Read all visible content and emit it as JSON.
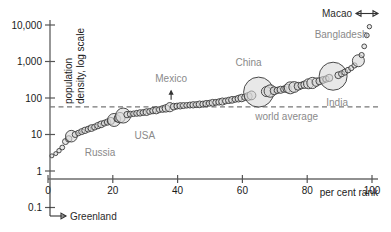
{
  "chart_data": {
    "type": "scatter",
    "title": "",
    "xlabel": "per cent rank",
    "ylabel_line1": "population",
    "ylabel_line2": "density, log scale",
    "xlim": [
      0,
      100
    ],
    "ylim": [
      0.1,
      30000
    ],
    "log_y": true,
    "grid": false,
    "x_ticks": [
      "0",
      "20",
      "40",
      "60",
      "80",
      "100"
    ],
    "x_tick_values": [
      0,
      20,
      40,
      60,
      80,
      100
    ],
    "y_ticks": [
      "10,000",
      "1,000",
      "100",
      "10",
      "1",
      "0.1"
    ],
    "y_tick_values": [
      10000,
      1000,
      100,
      10,
      1,
      0.1
    ],
    "reference_line": {
      "label": "world average",
      "value": 57
    },
    "annotations": [
      {
        "name": "Greenland",
        "note": "off-scale low, below 0.1",
        "arrow": "right"
      },
      {
        "name": "Macao",
        "note": "off-scale high, above 10,000",
        "arrow": "right"
      }
    ],
    "labelled_points": [
      {
        "name": "Russia",
        "x": 7,
        "y": 9
      },
      {
        "name": "USA",
        "x": 23,
        "y": 34
      },
      {
        "name": "Mexico",
        "x": 38,
        "y": 61
      },
      {
        "name": "China",
        "x": 65,
        "y": 145
      },
      {
        "name": "India",
        "x": 88,
        "y": 395
      },
      {
        "name": "Bangladesh",
        "x": 96,
        "y": 1100
      }
    ],
    "points": [
      {
        "x": 1.2,
        "y": 2.6,
        "r": 2.0
      },
      {
        "x": 2.4,
        "y": 3.0,
        "r": 2.0
      },
      {
        "x": 3.4,
        "y": 3.6,
        "r": 2.2
      },
      {
        "x": 4.4,
        "y": 4.4,
        "r": 2.4
      },
      {
        "x": 5.4,
        "y": 6.4,
        "r": 3.0
      },
      {
        "x": 6.4,
        "y": 7.6,
        "r": 3.2
      },
      {
        "x": 7.2,
        "y": 9.0,
        "r": 5.8
      },
      {
        "x": 8.4,
        "y": 10.0,
        "r": 3.0
      },
      {
        "x": 9.4,
        "y": 11.0,
        "r": 2.8
      },
      {
        "x": 10.4,
        "y": 12.0,
        "r": 3.0
      },
      {
        "x": 11.4,
        "y": 13.0,
        "r": 3.2
      },
      {
        "x": 12.4,
        "y": 14.0,
        "r": 3.0
      },
      {
        "x": 13.4,
        "y": 15.0,
        "r": 3.4
      },
      {
        "x": 14.4,
        "y": 16.0,
        "r": 3.0
      },
      {
        "x": 15.4,
        "y": 17.5,
        "r": 3.2
      },
      {
        "x": 16.4,
        "y": 19.0,
        "r": 3.4
      },
      {
        "x": 17.4,
        "y": 20.5,
        "r": 3.0
      },
      {
        "x": 18.4,
        "y": 22.0,
        "r": 3.2
      },
      {
        "x": 19.4,
        "y": 23.5,
        "r": 3.6
      },
      {
        "x": 20.4,
        "y": 25.0,
        "r": 6.5
      },
      {
        "x": 21.4,
        "y": 27.0,
        "r": 3.4
      },
      {
        "x": 22.2,
        "y": 29.0,
        "r": 5.2
      },
      {
        "x": 23.2,
        "y": 33.0,
        "r": 7.5
      },
      {
        "x": 24.4,
        "y": 35.0,
        "r": 3.2
      },
      {
        "x": 25.4,
        "y": 36.0,
        "r": 3.0
      },
      {
        "x": 26.4,
        "y": 37.0,
        "r": 2.8
      },
      {
        "x": 27.4,
        "y": 38.0,
        "r": 3.0
      },
      {
        "x": 28.4,
        "y": 39.0,
        "r": 3.2
      },
      {
        "x": 29.4,
        "y": 40.0,
        "r": 3.0
      },
      {
        "x": 30.4,
        "y": 41.0,
        "r": 3.4
      },
      {
        "x": 31.4,
        "y": 43.0,
        "r": 3.0
      },
      {
        "x": 32.4,
        "y": 45.0,
        "r": 3.2
      },
      {
        "x": 33.4,
        "y": 46.0,
        "r": 3.6
      },
      {
        "x": 34.4,
        "y": 48.0,
        "r": 3.0
      },
      {
        "x": 35.4,
        "y": 50.0,
        "r": 3.4
      },
      {
        "x": 36.4,
        "y": 52.0,
        "r": 3.8
      },
      {
        "x": 37.6,
        "y": 56.0,
        "r": 4.6
      },
      {
        "x": 38.8,
        "y": 58.0,
        "r": 3.4
      },
      {
        "x": 39.8,
        "y": 60.0,
        "r": 3.0
      },
      {
        "x": 40.8,
        "y": 61.0,
        "r": 3.2
      },
      {
        "x": 41.8,
        "y": 62.0,
        "r": 3.0
      },
      {
        "x": 42.8,
        "y": 63.0,
        "r": 2.8
      },
      {
        "x": 43.8,
        "y": 64.0,
        "r": 3.0
      },
      {
        "x": 44.8,
        "y": 65.0,
        "r": 3.2
      },
      {
        "x": 45.8,
        "y": 66.0,
        "r": 3.0
      },
      {
        "x": 46.8,
        "y": 67.0,
        "r": 3.4
      },
      {
        "x": 47.8,
        "y": 68.0,
        "r": 3.0
      },
      {
        "x": 48.8,
        "y": 70.0,
        "r": 3.2
      },
      {
        "x": 49.8,
        "y": 72.0,
        "r": 3.0
      },
      {
        "x": 50.8,
        "y": 74.0,
        "r": 3.4
      },
      {
        "x": 51.8,
        "y": 76.0,
        "r": 3.0
      },
      {
        "x": 52.8,
        "y": 78.0,
        "r": 3.2
      },
      {
        "x": 53.8,
        "y": 80.0,
        "r": 3.6
      },
      {
        "x": 54.8,
        "y": 83.0,
        "r": 3.0
      },
      {
        "x": 55.8,
        "y": 86.0,
        "r": 3.2
      },
      {
        "x": 56.8,
        "y": 89.0,
        "r": 3.4
      },
      {
        "x": 57.8,
        "y": 92.0,
        "r": 3.0
      },
      {
        "x": 58.8,
        "y": 96.0,
        "r": 3.4
      },
      {
        "x": 59.8,
        "y": 100.0,
        "r": 3.8
      },
      {
        "x": 60.8,
        "y": 105.0,
        "r": 3.2
      },
      {
        "x": 61.8,
        "y": 110.0,
        "r": 4.0
      },
      {
        "x": 62.8,
        "y": 118.0,
        "r": 4.4
      },
      {
        "x": 65.0,
        "y": 145.0,
        "r": 15.0
      },
      {
        "x": 67.4,
        "y": 150.0,
        "r": 5.0
      },
      {
        "x": 68.6,
        "y": 155.0,
        "r": 6.2
      },
      {
        "x": 69.8,
        "y": 158.0,
        "r": 4.0
      },
      {
        "x": 70.8,
        "y": 162.0,
        "r": 3.2
      },
      {
        "x": 71.8,
        "y": 168.0,
        "r": 3.6
      },
      {
        "x": 72.8,
        "y": 175.0,
        "r": 3.2
      },
      {
        "x": 73.8,
        "y": 182.0,
        "r": 4.2
      },
      {
        "x": 74.8,
        "y": 190.0,
        "r": 6.0
      },
      {
        "x": 76.0,
        "y": 200.0,
        "r": 5.4
      },
      {
        "x": 77.2,
        "y": 210.0,
        "r": 4.0
      },
      {
        "x": 78.2,
        "y": 220.0,
        "r": 3.4
      },
      {
        "x": 79.2,
        "y": 232.0,
        "r": 3.8
      },
      {
        "x": 80.4,
        "y": 245.0,
        "r": 5.0
      },
      {
        "x": 81.6,
        "y": 258.0,
        "r": 5.6
      },
      {
        "x": 82.8,
        "y": 272.0,
        "r": 4.2
      },
      {
        "x": 83.8,
        "y": 290.0,
        "r": 3.6
      },
      {
        "x": 84.8,
        "y": 310.0,
        "r": 3.4
      },
      {
        "x": 85.8,
        "y": 330.0,
        "r": 3.2
      },
      {
        "x": 86.8,
        "y": 355.0,
        "r": 3.6
      },
      {
        "x": 88.0,
        "y": 395.0,
        "r": 14.0
      },
      {
        "x": 89.6,
        "y": 420.0,
        "r": 3.4
      },
      {
        "x": 90.6,
        "y": 460.0,
        "r": 3.0
      },
      {
        "x": 91.6,
        "y": 510.0,
        "r": 3.0
      },
      {
        "x": 92.6,
        "y": 580.0,
        "r": 2.8
      },
      {
        "x": 93.6,
        "y": 660.0,
        "r": 2.6
      },
      {
        "x": 94.6,
        "y": 780.0,
        "r": 2.6
      },
      {
        "x": 95.8,
        "y": 1050.0,
        "r": 6.0
      },
      {
        "x": 96.8,
        "y": 1500.0,
        "r": 2.6
      },
      {
        "x": 97.6,
        "y": 2600.0,
        "r": 2.4
      },
      {
        "x": 98.4,
        "y": 5200.0,
        "r": 2.4
      },
      {
        "x": 99.2,
        "y": 9000.0,
        "r": 2.2
      }
    ]
  }
}
